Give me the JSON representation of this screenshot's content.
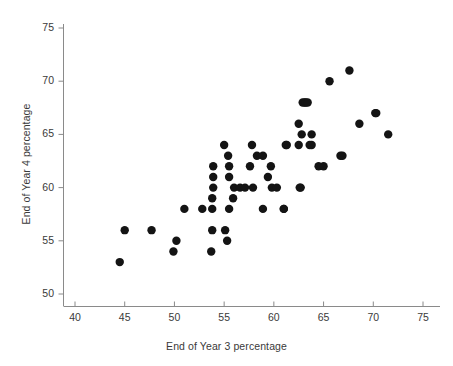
{
  "chart_data": {
    "type": "scatter",
    "title": "",
    "xlabel": "End of Year 3 percentage",
    "ylabel": "End of Year 4 percentage",
    "xlim": [
      37.5,
      77
    ],
    "ylim": [
      48.5,
      76.5
    ],
    "xticks": [
      40,
      45,
      50,
      55,
      60,
      65,
      70,
      75
    ],
    "yticks": [
      50,
      55,
      60,
      65,
      70,
      75
    ],
    "xtick_labels": [
      "40",
      "45",
      "50",
      "55",
      "60",
      "65",
      "70",
      "75"
    ],
    "ytick_labels": [
      "50",
      "55",
      "60",
      "65",
      "70",
      "75"
    ],
    "grid": false,
    "legend": null,
    "marker": "filled-circle",
    "marker_color": "#141414",
    "marker_size": 4.2,
    "n_points": 62,
    "points": [
      [
        44.5,
        53
      ],
      [
        45.0,
        56
      ],
      [
        47.7,
        56
      ],
      [
        49.9,
        54
      ],
      [
        50.2,
        55
      ],
      [
        51.0,
        58
      ],
      [
        52.8,
        58
      ],
      [
        53.7,
        54
      ],
      [
        53.8,
        56
      ],
      [
        53.8,
        58
      ],
      [
        53.8,
        59
      ],
      [
        53.9,
        60
      ],
      [
        53.9,
        61
      ],
      [
        53.9,
        62
      ],
      [
        55.0,
        64
      ],
      [
        55.1,
        56
      ],
      [
        55.3,
        55
      ],
      [
        55.4,
        63
      ],
      [
        55.5,
        58
      ],
      [
        55.5,
        61
      ],
      [
        55.5,
        62
      ],
      [
        55.9,
        59
      ],
      [
        56.0,
        60
      ],
      [
        56.6,
        60
      ],
      [
        57.1,
        60
      ],
      [
        57.6,
        62
      ],
      [
        57.8,
        64
      ],
      [
        57.9,
        60
      ],
      [
        58.3,
        63
      ],
      [
        58.9,
        58
      ],
      [
        58.9,
        63
      ],
      [
        59.4,
        61
      ],
      [
        59.7,
        62
      ],
      [
        59.8,
        60
      ],
      [
        60.3,
        60
      ],
      [
        61.0,
        58
      ],
      [
        61.0,
        58
      ],
      [
        61.2,
        64
      ],
      [
        61.3,
        64
      ],
      [
        62.5,
        64
      ],
      [
        62.5,
        66
      ],
      [
        62.6,
        60
      ],
      [
        62.7,
        60
      ],
      [
        62.8,
        65
      ],
      [
        62.9,
        68
      ],
      [
        63.1,
        68
      ],
      [
        63.2,
        68
      ],
      [
        63.4,
        68
      ],
      [
        63.6,
        64
      ],
      [
        63.8,
        64
      ],
      [
        63.8,
        65
      ],
      [
        64.5,
        62
      ],
      [
        65.0,
        62
      ],
      [
        65.6,
        70
      ],
      [
        66.7,
        63
      ],
      [
        66.9,
        63
      ],
      [
        67.6,
        71
      ],
      [
        68.6,
        66
      ],
      [
        70.2,
        67
      ],
      [
        70.3,
        67
      ],
      [
        71.5,
        65
      ]
    ]
  },
  "axes": {
    "x_title": "End of Year 3 percentage",
    "y_title": "End of Year 4 percentage"
  }
}
